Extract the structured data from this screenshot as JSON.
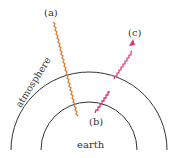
{
  "diagram": {
    "labels": {
      "a": "(a)",
      "b": "(b)",
      "c": "(c)",
      "atmosphere": "atmosphere",
      "earth": "earth"
    },
    "colors": {
      "incoming_ray": "#d9803a",
      "outgoing_ray": "#e0336a",
      "arcs": "#333333",
      "text": "#333333"
    },
    "elements": [
      {
        "id": "outer-arc",
        "description": "top of atmosphere boundary"
      },
      {
        "id": "inner-arc",
        "description": "earth surface boundary"
      },
      {
        "id": "ray-a",
        "description": "incoming wavy ray from (a) to (b)"
      },
      {
        "id": "ray-c",
        "description": "outgoing wavy ray from (b) to (c) with arrowhead"
      }
    ]
  }
}
